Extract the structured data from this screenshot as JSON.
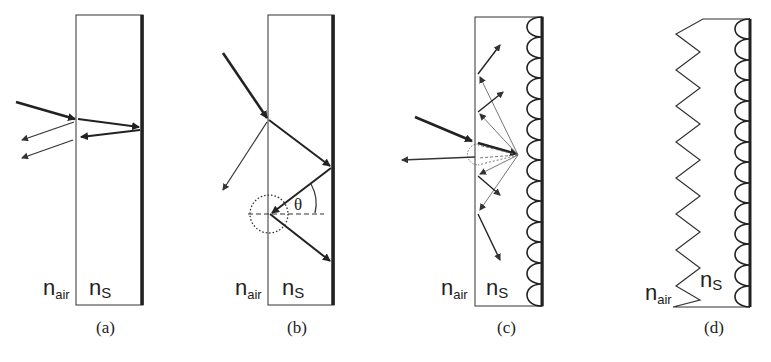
{
  "figure": {
    "panels": [
      {
        "id": "a",
        "caption": "(a)",
        "medium_left": "n",
        "medium_left_sub": "air",
        "medium_right": "n",
        "medium_right_sub": "S"
      },
      {
        "id": "b",
        "caption": "(b)",
        "medium_left": "n",
        "medium_left_sub": "air",
        "medium_right": "n",
        "medium_right_sub": "S",
        "angle_label": "θ"
      },
      {
        "id": "c",
        "caption": "(c)",
        "medium_left": "n",
        "medium_left_sub": "air",
        "medium_right": "n",
        "medium_right_sub": "S"
      },
      {
        "id": "d",
        "caption": "(d)",
        "medium_left": "n",
        "medium_left_sub": "air",
        "medium_right": "n",
        "medium_right_sub": "S"
      }
    ]
  },
  "colors": {
    "line": "#222222",
    "thin": "#555555",
    "background": "#ffffff"
  }
}
